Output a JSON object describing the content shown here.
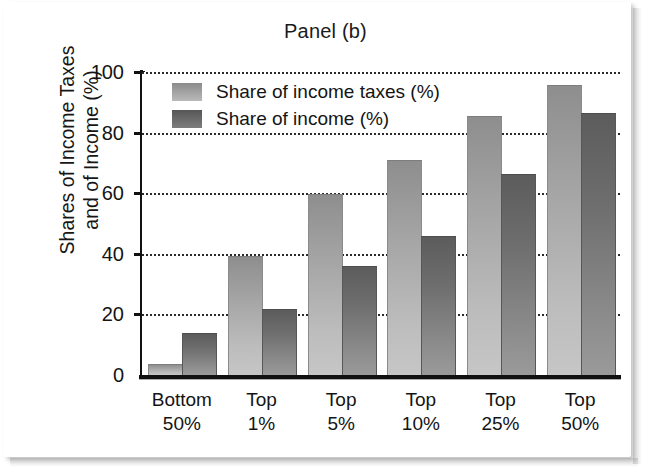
{
  "chart_data": {
    "type": "bar",
    "title": "Panel (b)",
    "xlabel": "",
    "ylabel": "Shares of Income Taxes and of Income (%)",
    "ylabel_lines": [
      "Shares of Income Taxes",
      "and of Income (%)"
    ],
    "categories": [
      "Bottom 50%",
      "Top 1%",
      "Top 5%",
      "Top 10%",
      "Top 25%",
      "Top 50%"
    ],
    "category_lines": [
      [
        "Bottom",
        "50%"
      ],
      [
        "Top",
        "1%"
      ],
      [
        "Top",
        "5%"
      ],
      [
        "Top",
        "10%"
      ],
      [
        "Top",
        "25%"
      ],
      [
        "Top",
        "50%"
      ]
    ],
    "series": [
      {
        "name": "Share of income taxes (%)",
        "color": "#a9a9a9",
        "values": [
          3.3,
          39.0,
          59.5,
          70.5,
          85.0,
          95.5
        ]
      },
      {
        "name": "Share of income (%)",
        "color": "#6b6b6b",
        "values": [
          13.5,
          21.5,
          35.5,
          45.5,
          66.0,
          86.0
        ]
      }
    ],
    "ylim": [
      0,
      100
    ],
    "yticks": [
      0,
      20,
      40,
      60,
      80,
      100
    ],
    "ytick_labels": [
      "0",
      "20",
      "40",
      "60",
      "80",
      "100"
    ],
    "grid": true,
    "grid_style": "dotted",
    "legend_position": "upper left"
  },
  "legend": {
    "items": [
      {
        "label": "Share of income taxes (%)",
        "swatch": "light"
      },
      {
        "label": "Share of income (%)",
        "swatch": "dark"
      }
    ]
  }
}
